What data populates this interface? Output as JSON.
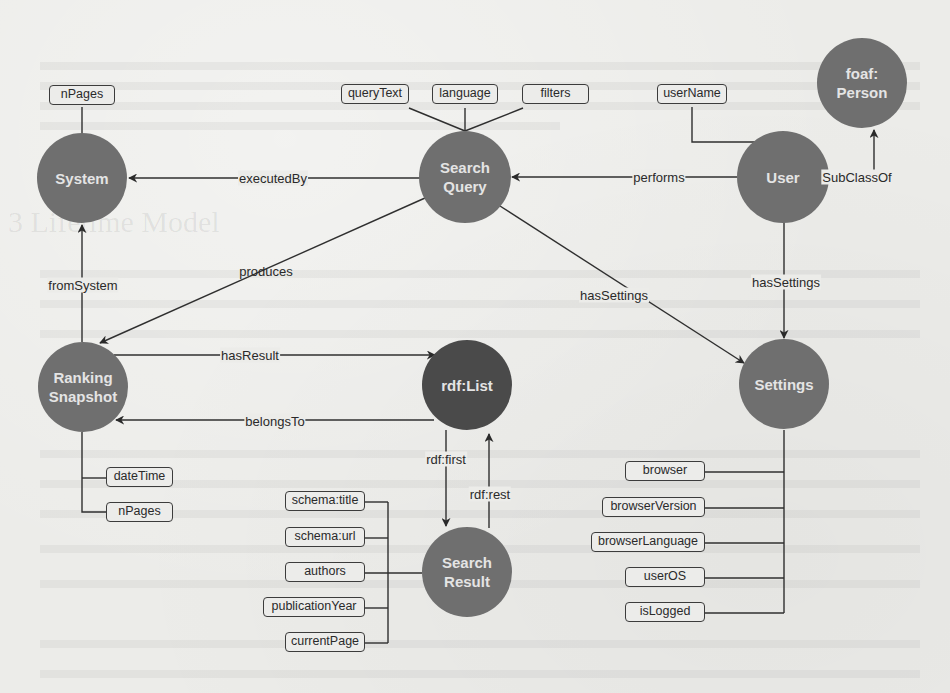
{
  "diagram": {
    "type": "ontology-graph",
    "colors": {
      "node_fill": "#6f6f6f",
      "node_fill_highlight": "#4a4a4a",
      "node_text": "#e4e4e4",
      "edge": "#2f2f2f",
      "attr_border": "#3c3c3c",
      "background": "#ecece9"
    },
    "nodes": {
      "system": {
        "label": "System"
      },
      "search_query": {
        "label": "Search\nQuery"
      },
      "user": {
        "label": "User"
      },
      "foaf_person": {
        "label": "foaf:\nPerson"
      },
      "ranking_snapshot": {
        "label": "Ranking\nSnapshot"
      },
      "rdf_list": {
        "label": "rdf:List"
      },
      "settings": {
        "label": "Settings"
      },
      "search_result": {
        "label": "Search\nResult"
      }
    },
    "attributes": {
      "system": [
        "nPages"
      ],
      "search_query": [
        "queryText",
        "language",
        "filters"
      ],
      "user": [
        "userName"
      ],
      "ranking_snapshot": [
        "dateTime",
        "nPages"
      ],
      "search_result": [
        "schema:title",
        "schema:url",
        "authors",
        "publicationYear",
        "currentPage"
      ],
      "settings": [
        "browser",
        "browserVersion",
        "browserLanguage",
        "userOS",
        "isLogged"
      ]
    },
    "edges": {
      "executed_by": {
        "label": "executedBy",
        "from": "Search Query",
        "to": "System"
      },
      "performs": {
        "label": "performs",
        "from": "User",
        "to": "Search Query"
      },
      "subclass_of": {
        "label": "SubClassOf",
        "from": "User",
        "to": "foaf:Person"
      },
      "from_system": {
        "label": "fromSystem",
        "from": "Ranking Snapshot",
        "to": "System"
      },
      "produces": {
        "label": "produces",
        "from": "Search Query",
        "to": "Ranking Snapshot"
      },
      "has_settings_query": {
        "label": "hasSettings",
        "from": "Search Query",
        "to": "Settings"
      },
      "has_settings_user": {
        "label": "hasSettings",
        "from": "User",
        "to": "Settings"
      },
      "has_result": {
        "label": "hasResult",
        "from": "Ranking Snapshot",
        "to": "rdf:List"
      },
      "belongs_to": {
        "label": "belongsTo",
        "from": "rdf:List",
        "to": "Ranking Snapshot"
      },
      "rdf_first": {
        "label": "rdf:first",
        "from": "rdf:List",
        "to": "Search Result"
      },
      "rdf_rest": {
        "label": "rdf:rest",
        "from": "Search Result",
        "to": "rdf:List"
      }
    }
  },
  "background_bleed": {
    "heading": "3   Lifetime Model"
  }
}
